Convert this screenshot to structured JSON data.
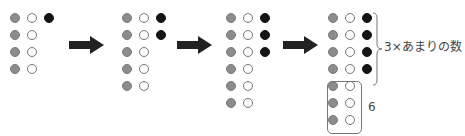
{
  "colors": {
    "gray": "#8c8c8c",
    "white": "#ffffff",
    "black": "#151515",
    "arrow": "#222222"
  },
  "stages": [
    {
      "rows": [
        [
          "gray",
          "white",
          "black"
        ],
        [
          "gray",
          "white"
        ],
        [
          "gray",
          "white"
        ],
        [
          "gray",
          "white"
        ]
      ]
    },
    {
      "rows": [
        [
          "gray",
          "white",
          "black"
        ],
        [
          "gray",
          "white",
          "black"
        ],
        [
          "gray",
          "white"
        ],
        [
          "gray",
          "white"
        ],
        [
          "gray",
          "white"
        ]
      ]
    },
    {
      "rows": [
        [
          "gray",
          "white",
          "black"
        ],
        [
          "gray",
          "white",
          "black"
        ],
        [
          "gray",
          "white",
          "black"
        ],
        [
          "gray",
          "white"
        ],
        [
          "gray",
          "white"
        ],
        [
          "gray",
          "white"
        ]
      ]
    },
    {
      "rows": [
        [
          "gray",
          "white",
          "black"
        ],
        [
          "gray",
          "white",
          "black"
        ],
        [
          "gray",
          "white",
          "black"
        ],
        [
          "gray",
          "white",
          "black"
        ],
        [
          "gray",
          "white"
        ],
        [
          "gray",
          "white"
        ],
        [
          "gray",
          "white"
        ]
      ]
    }
  ],
  "labels": {
    "brace_label": "3×あまりの数",
    "box_label": "6"
  }
}
